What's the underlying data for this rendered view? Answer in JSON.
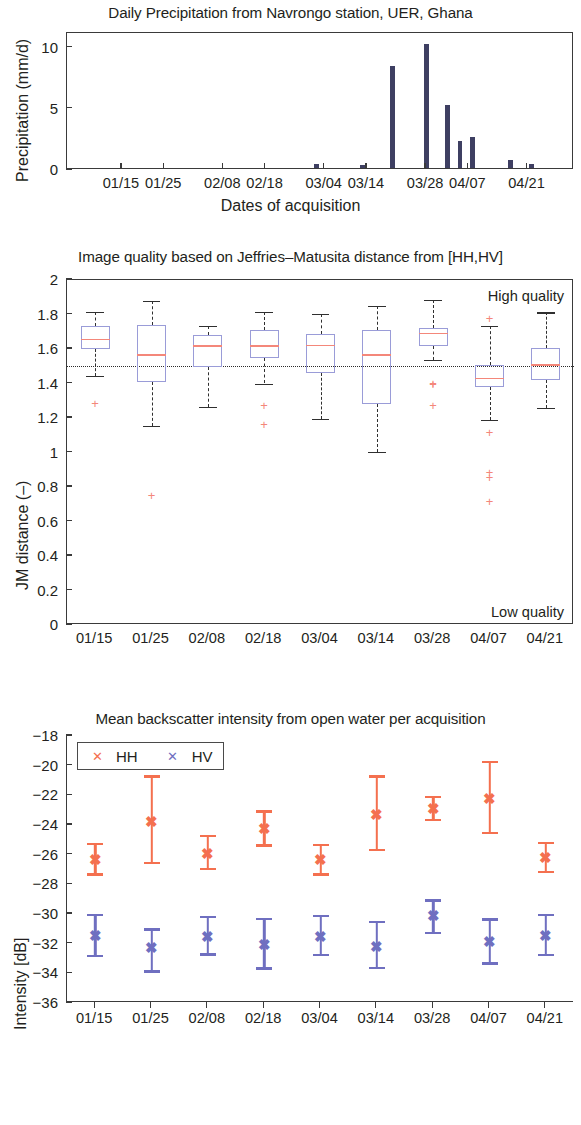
{
  "figure": {
    "width": 581,
    "height": 1125,
    "colors": {
      "precip_bar": "#3e3f62",
      "box_outline": "#9a9cd8",
      "median": "#f4877a",
      "whisker": "#2f2f2f",
      "hh": "#f4704f",
      "hv": "#6f6fc0",
      "axis": "#3a3a3a",
      "text": "#231f20"
    }
  },
  "chart_data": [
    {
      "type": "bar",
      "title": "Daily Precipitation from Navrongo station, UER, Ghana",
      "xlabel": "Dates of acquisition",
      "ylabel": "Precipitation (mm/d)",
      "ylim": [
        0,
        11.2
      ],
      "yticks": [
        0,
        5,
        10
      ],
      "ytick_labels": [
        "0",
        "5",
        "10"
      ],
      "xlim": [
        0,
        120
      ],
      "xtick_positions": [
        13,
        23,
        37,
        47,
        61,
        71,
        85,
        95,
        109
      ],
      "xtick_labels": [
        "01/15",
        "01/25",
        "02/08",
        "02/18",
        "03/04",
        "03/14",
        "03/28",
        "04/07",
        "04/21"
      ],
      "grid": false,
      "x": [
        59,
        70,
        77,
        85,
        90,
        93,
        96,
        105,
        110
      ],
      "values": [
        0.35,
        0.28,
        8.35,
        10.15,
        5.15,
        2.2,
        2.55,
        0.65,
        0.35
      ],
      "bar_labels": [
        "03/02",
        "03/13",
        "03/20",
        "03/29",
        "04/03",
        "04/06",
        "04/09",
        "04/18",
        "04/23"
      ]
    },
    {
      "type": "box",
      "title": "Image quality based on Jeffries–Matusita distance from [HH,HV]",
      "xlabel": "",
      "ylabel": "JM distance (–)",
      "ylim": [
        0,
        2
      ],
      "yticks": [
        0,
        0.2,
        0.4,
        0.6,
        0.8,
        1,
        1.2,
        1.4,
        1.6,
        1.8,
        2
      ],
      "ytick_labels": [
        "0",
        "0.2",
        "0.4",
        "0.6",
        "0.8",
        "1",
        "1.2",
        "1.4",
        "1.6",
        "1.8",
        "2"
      ],
      "categories": [
        "01/15",
        "01/25",
        "02/08",
        "02/18",
        "03/04",
        "03/14",
        "03/28",
        "04/07",
        "04/21"
      ],
      "threshold": 1.5,
      "annotations": [
        {
          "text": "High quality",
          "value": 1.9
        },
        {
          "text": "Low quality",
          "value": 0.07
        }
      ],
      "boxes": [
        {
          "category": "01/15",
          "whisker_low": 1.445,
          "q1": 1.598,
          "median": 1.655,
          "q3": 1.733,
          "whisker_high": 1.815,
          "outliers": [
            1.285
          ]
        },
        {
          "category": "01/25",
          "whisker_low": 1.155,
          "q1": 1.41,
          "median": 1.565,
          "q3": 1.737,
          "whisker_high": 1.88,
          "outliers": [
            0.755
          ]
        },
        {
          "category": "02/08",
          "whisker_low": 1.265,
          "q1": 1.497,
          "median": 1.617,
          "q3": 1.682,
          "whisker_high": 1.733,
          "outliers": []
        },
        {
          "category": "02/18",
          "whisker_low": 1.4,
          "q1": 1.545,
          "median": 1.617,
          "q3": 1.708,
          "whisker_high": 1.815,
          "outliers": [
            1.275,
            1.168
          ]
        },
        {
          "category": "03/04",
          "whisker_low": 1.197,
          "q1": 1.463,
          "median": 1.622,
          "q3": 1.685,
          "whisker_high": 1.805,
          "outliers": []
        },
        {
          "category": "03/14",
          "whisker_low": 1.002,
          "q1": 1.282,
          "median": 1.565,
          "q3": 1.708,
          "whisker_high": 1.852,
          "outliers": []
        },
        {
          "category": "03/28",
          "whisker_low": 1.537,
          "q1": 1.62,
          "median": 1.69,
          "q3": 1.722,
          "whisker_high": 1.885,
          "outliers": [
            1.405,
            1.395,
            1.278
          ]
        },
        {
          "category": "04/07",
          "whisker_low": 1.188,
          "q1": 1.378,
          "median": 1.428,
          "q3": 1.505,
          "whisker_high": 1.735,
          "outliers": [
            1.782,
            1.118,
            0.888,
            0.858,
            0.72
          ]
        },
        {
          "category": "04/21",
          "whisker_low": 1.258,
          "q1": 1.42,
          "median": 1.508,
          "q3": 1.603,
          "whisker_high": 1.812,
          "outliers": []
        }
      ]
    },
    {
      "type": "errorbar",
      "title": "Mean backscatter intensity from open water per acquisition",
      "xlabel": "",
      "ylabel": "Intensity [dB]",
      "ylim": [
        -36,
        -18
      ],
      "yticks": [
        -36,
        -34,
        -32,
        -30,
        -28,
        -26,
        -24,
        -22,
        -20,
        -18
      ],
      "ytick_labels": [
        "−36",
        "−34",
        "−32",
        "−30",
        "−28",
        "−26",
        "−24",
        "−22",
        "−20",
        "−18"
      ],
      "categories": [
        "01/15",
        "01/25",
        "02/08",
        "02/18",
        "03/04",
        "03/14",
        "03/28",
        "04/07",
        "04/21"
      ],
      "legend": {
        "position": "top-left",
        "entries": [
          "HH",
          "HV"
        ]
      },
      "series": [
        {
          "name": "HH",
          "color": "#f4704f",
          "marker": "x",
          "values": [
            -26.35,
            -23.8,
            -25.95,
            -24.3,
            -26.35,
            -23.3,
            -22.95,
            -22.25,
            -26.25
          ],
          "err_low": [
            -27.4,
            -26.65,
            -27.05,
            -25.45,
            -27.4,
            -25.75,
            -23.75,
            -24.6,
            -27.25
          ],
          "err_high": [
            -25.35,
            -20.8,
            -24.8,
            -23.15,
            -25.4,
            -20.8,
            -22.2,
            -19.8,
            -25.3
          ]
        },
        {
          "name": "HV",
          "color": "#6f6fc0",
          "marker": "x",
          "values": [
            -31.5,
            -32.3,
            -31.55,
            -32.1,
            -31.55,
            -32.2,
            -30.15,
            -31.9,
            -31.45
          ],
          "err_low": [
            -32.9,
            -33.95,
            -32.8,
            -33.75,
            -32.85,
            -33.7,
            -31.35,
            -33.4,
            -32.85
          ],
          "err_high": [
            -30.15,
            -31.1,
            -30.25,
            -30.4,
            -30.2,
            -30.6,
            -29.15,
            -30.45,
            -30.15
          ]
        }
      ]
    }
  ]
}
